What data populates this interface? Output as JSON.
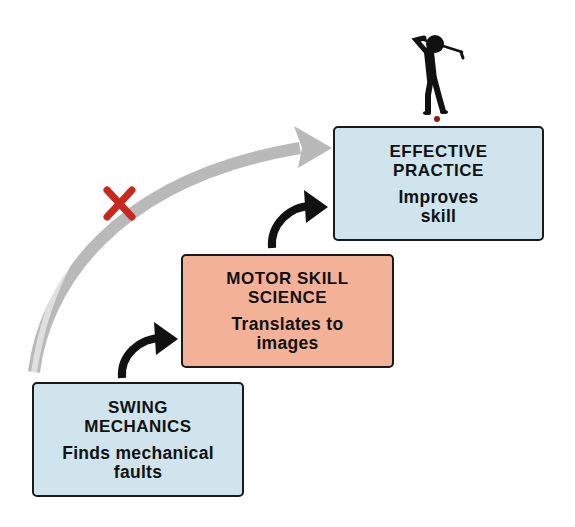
{
  "colors": {
    "blue_box": "#cfe4ec",
    "orange_box": "#f3b198",
    "border": "#1a1a1a",
    "curve_arrow": "#b9b9b9",
    "x_mark": "#c8281e",
    "step_arrow": "#111111",
    "golf_ball": "#8b1a10"
  },
  "steps": [
    {
      "title_line1": "SWING",
      "title_line2": "MECHANICS",
      "desc_line1": "Finds mechanical",
      "desc_line2": "faults",
      "color": "blue"
    },
    {
      "title_line1": "MOTOR SKILL",
      "title_line2": "SCIENCE",
      "desc_line1": "Translates to",
      "desc_line2": "images",
      "color": "orange"
    },
    {
      "title_line1": "EFFECTIVE",
      "title_line2": "PRACTICE",
      "desc_line1": "Improves",
      "desc_line2": "skill",
      "color": "blue"
    }
  ],
  "icons": {
    "golfer": "golfer-icon",
    "blocked_path": "x-mark-icon",
    "direct_path_arrow": "curved-arrow-icon",
    "step_arrows": "curved-step-arrow-icon"
  }
}
